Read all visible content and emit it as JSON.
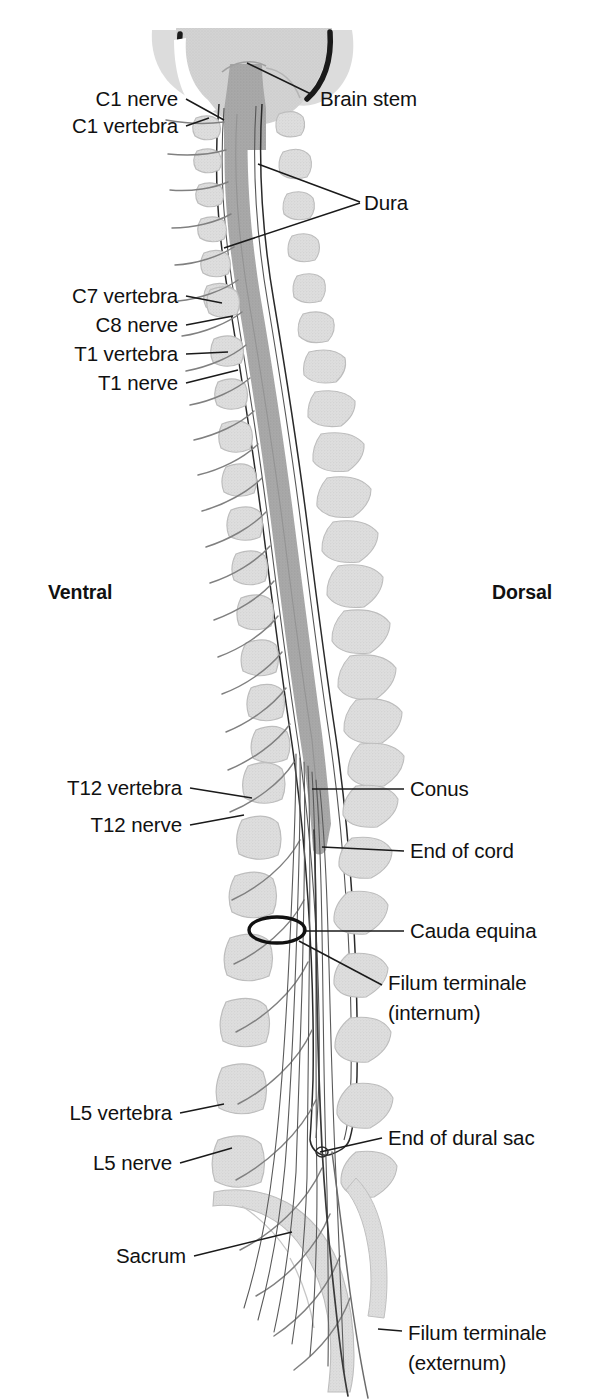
{
  "figure": {
    "orientation": {
      "ventral_label": "Ventral",
      "dorsal_label": "Dorsal"
    },
    "colors": {
      "bone_light": "#dcdcdc",
      "bone_outline": "#b4b4b4",
      "cord_gray": "#a9a9a9",
      "cord_dark": "#9a9a9a",
      "brain_light": "#d8d8d8",
      "brain_mid": "#c6c6c6",
      "skull_dark": "#1a1a1a",
      "leader_line": "#1a1a1a",
      "nerve_line": "#6e6e6e",
      "dura_line": "#2a2a2a",
      "text": "#111111",
      "background": "#ffffff"
    },
    "labels": [
      {
        "id": "c1-nerve",
        "text": "C1 nerve",
        "side": "left",
        "x": 178,
        "y": 86,
        "lines": 1
      },
      {
        "id": "c1-vertebra",
        "text": "C1 vertebra",
        "side": "left",
        "x": 178,
        "y": 113,
        "lines": 1
      },
      {
        "id": "brain-stem",
        "text": "Brain stem",
        "side": "right",
        "x": 320,
        "y": 86,
        "lines": 1
      },
      {
        "id": "dura",
        "text": "Dura",
        "side": "right",
        "x": 364,
        "y": 190,
        "lines": 1
      },
      {
        "id": "c7-vertebra",
        "text": "C7 vertebra",
        "side": "left",
        "x": 178,
        "y": 283,
        "lines": 1
      },
      {
        "id": "c8-nerve",
        "text": "C8 nerve",
        "side": "left",
        "x": 178,
        "y": 312,
        "lines": 1
      },
      {
        "id": "t1-vertebra",
        "text": "T1 vertebra",
        "side": "left",
        "x": 178,
        "y": 341,
        "lines": 1
      },
      {
        "id": "t1-nerve",
        "text": "T1 nerve",
        "side": "left",
        "x": 178,
        "y": 370,
        "lines": 1
      },
      {
        "id": "ventral",
        "text": "Ventral",
        "side": "left",
        "x": 115,
        "y": 580,
        "lines": 1,
        "bold": true
      },
      {
        "id": "dorsal",
        "text": "Dorsal",
        "side": "right",
        "x": 492,
        "y": 580,
        "lines": 1,
        "bold": true
      },
      {
        "id": "t12-vertebra",
        "text": "T12 vertebra",
        "side": "left",
        "x": 182,
        "y": 775,
        "lines": 1
      },
      {
        "id": "t12-nerve",
        "text": "T12 nerve",
        "side": "left",
        "x": 182,
        "y": 812,
        "lines": 1
      },
      {
        "id": "conus",
        "text": "Conus",
        "side": "right",
        "x": 410,
        "y": 776,
        "lines": 1
      },
      {
        "id": "end-of-cord",
        "text": "End of cord",
        "side": "right",
        "x": 410,
        "y": 838,
        "lines": 1
      },
      {
        "id": "cauda-equina",
        "text": "Cauda equina",
        "side": "right",
        "x": 410,
        "y": 918,
        "lines": 1
      },
      {
        "id": "filum-internum",
        "text": "Filum terminale\n(internum)",
        "side": "right",
        "x": 388,
        "y": 968,
        "lines": 2
      },
      {
        "id": "l5-vertebra",
        "text": "L5 vertebra",
        "side": "left",
        "x": 172,
        "y": 1100,
        "lines": 1
      },
      {
        "id": "l5-nerve",
        "text": "L5 nerve",
        "side": "left",
        "x": 172,
        "y": 1150,
        "lines": 1
      },
      {
        "id": "end-dural-sac",
        "text": "End of dural sac",
        "side": "right",
        "x": 388,
        "y": 1125,
        "lines": 1
      },
      {
        "id": "sacrum",
        "text": "Sacrum",
        "side": "left",
        "x": 186,
        "y": 1243,
        "lines": 1
      },
      {
        "id": "filum-externum",
        "text": "Filum terminale\n(externum)",
        "side": "right",
        "x": 408,
        "y": 1318,
        "lines": 2
      }
    ],
    "anatomy": {
      "regions": [
        "brain",
        "brain stem",
        "cervical vertebrae",
        "thoracic vertebrae",
        "lumbar vertebrae",
        "sacrum"
      ],
      "spinal_cord": "gray shaded band running from brain stem to conus medullaris",
      "dura": "paired thin lines enclosing the cord, ending at the dural sac",
      "cauda_equina": "bundle of nerve roots below the conus",
      "filum_terminale": "thin filament continuing from conus through dural sac"
    }
  }
}
